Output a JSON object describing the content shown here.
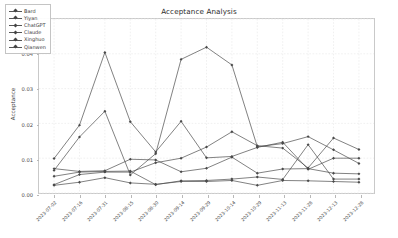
{
  "chart_data": {
    "type": "line",
    "title": "Acceptance Analysis",
    "xlabel": "",
    "ylabel": "Acceptance",
    "ylim": [
      0.0,
      0.05
    ],
    "yticks": [
      "0.00",
      "0.01",
      "0.02",
      "0.03",
      "0.04",
      "0.05"
    ],
    "ytick_values": [
      0.0,
      0.01,
      0.02,
      0.03,
      0.04,
      0.05
    ],
    "grid": true,
    "legend_position": "upper left",
    "categories": [
      "2023-07-02",
      "2023-07-16",
      "2023-07-31",
      "2023-08-15",
      "2023-08-30",
      "2023-09-14",
      "2023-09-29",
      "2023-10-14",
      "2023-10-29",
      "2023-11-13",
      "2023-11-28",
      "2023-12-13",
      "2023-12-28"
    ],
    "series": [
      {
        "name": "Bard",
        "values": [
          0.0099,
          0.0195,
          0.0404,
          0.0205,
          0.0118,
          0.0206,
          0.0101,
          0.0105,
          0.0131,
          0.0146,
          0.0068,
          0.01,
          0.01
        ]
      },
      {
        "name": "Yiyan",
        "values": [
          0.0065,
          0.0161,
          0.0235,
          0.0052,
          0.0113,
          0.0384,
          0.0419,
          0.0368,
          0.0133,
          0.0142,
          0.0162,
          0.0124,
          0.0085
        ]
      },
      {
        "name": "ChatGPT",
        "values": [
          0.007,
          0.0062,
          0.0064,
          0.0097,
          0.0095,
          0.0061,
          0.0071,
          0.0103,
          0.0057,
          0.0069,
          0.007,
          0.0057,
          0.0055
        ]
      },
      {
        "name": "Claude",
        "values": [
          0.0024,
          0.0053,
          0.006,
          0.006,
          0.0087,
          0.01,
          0.0132,
          0.0176,
          0.0136,
          0.0129,
          0.0072,
          0.0158,
          0.0125
        ]
      },
      {
        "name": "Xinghuo",
        "values": [
          0.0048,
          0.006,
          0.0062,
          0.0063,
          0.0024,
          0.0035,
          0.0036,
          0.004,
          0.0046,
          0.0039,
          0.0139,
          0.004,
          0.004
        ]
      },
      {
        "name": "Qianwen",
        "values": [
          0.0022,
          0.0031,
          0.0044,
          0.0029,
          0.0025,
          0.0033,
          0.0033,
          0.0036,
          0.0022,
          0.0036,
          0.0035,
          0.0033,
          0.0031
        ]
      }
    ],
    "series_color": "#4a4a4a"
  }
}
